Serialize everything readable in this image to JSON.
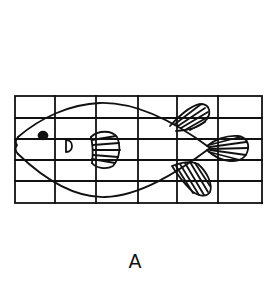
{
  "figure": {
    "caption": "A",
    "grid": {
      "columns": 6,
      "rows": 5,
      "x_lines": [
        15,
        55,
        96,
        138,
        177,
        218,
        262
      ],
      "y_lines": [
        96,
        118,
        139,
        160,
        181,
        203
      ]
    },
    "parts": [
      "body",
      "eye",
      "mouth",
      "gill",
      "pectoral-fin",
      "dorsal-fin",
      "pelvic-fin",
      "tail-fin"
    ],
    "colors": {
      "ink": "#111111",
      "background": "#ffffff"
    }
  }
}
